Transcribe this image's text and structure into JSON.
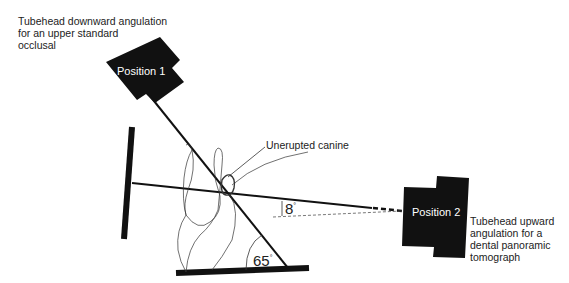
{
  "diagram": {
    "position1": {
      "label": "Position 1",
      "caption": "Tubehead downward angulation\nfor an upper standard\nocclusal"
    },
    "position2": {
      "label": "Position 2",
      "caption": "Tubehead upward\nangulation for a\ndental panoramic\ntomograph"
    },
    "structure_label": "Unerupted canine",
    "angles": {
      "upper_beam": "65",
      "panoramic_beam": "8",
      "degree_mark": "°"
    },
    "colors": {
      "ink": "#111111",
      "text": "#222222",
      "background": "#ffffff"
    }
  }
}
